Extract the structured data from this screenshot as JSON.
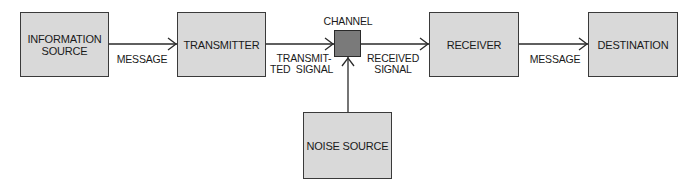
{
  "diagram": {
    "type": "communication-system-block-diagram",
    "nodes": {
      "information_source": {
        "line1": "INFORMATION",
        "line2": "SOURCE"
      },
      "transmitter": {
        "label": "TRANSMITTER"
      },
      "channel": {
        "label": "CHANNEL"
      },
      "receiver": {
        "label": "RECEIVER"
      },
      "destination": {
        "label": "DESTINATION"
      },
      "noise_source": {
        "label": "NOISE SOURCE"
      }
    },
    "edges": {
      "message_1": {
        "label": "MESSAGE"
      },
      "transmitted_signal": {
        "line1": "TRANSMIT-",
        "line2": "TED  SIGNAL"
      },
      "received_signal": {
        "line1": "RECEIVED",
        "line2": "SIGNAL"
      },
      "message_2": {
        "label": "MESSAGE"
      }
    },
    "colors": {
      "box_fill": "#d9d9d9",
      "channel_fill": "#7a7a7a",
      "stroke": "#3a3a3a"
    }
  }
}
